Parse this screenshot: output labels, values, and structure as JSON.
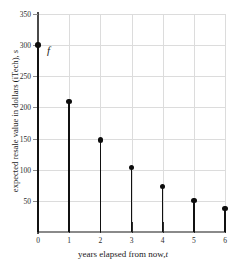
{
  "chart_data": {
    "type": "scatter",
    "plot_style": "stem",
    "title": "",
    "xlabel": "years elapsed from now, t",
    "ylabel": "expected resale value in dollars (iTech), s",
    "xlabel_main": "years elapsed from now,",
    "xlabel_var": "t",
    "ylabel_main": "expected resale value in dollars (iTech),",
    "ylabel_var": "s",
    "x": [
      0,
      1,
      2,
      3,
      4,
      5,
      6
    ],
    "values": [
      300,
      210,
      148,
      104,
      73,
      51,
      38
    ],
    "xlim": [
      0,
      6
    ],
    "ylim": [
      0,
      350
    ],
    "xticks": [
      "0",
      "1",
      "2",
      "3",
      "4",
      "5",
      "6"
    ],
    "yticks": [
      "50",
      "100",
      "150",
      "200",
      "250",
      "300",
      "350"
    ],
    "ytick_values": [
      50,
      100,
      150,
      200,
      250,
      300,
      350
    ],
    "grid": true,
    "grid_color": "#dcdcdc",
    "legend": "none",
    "annotations": [
      {
        "text": "f",
        "x": 0.45,
        "y": 272,
        "style": "italic"
      }
    ],
    "marker_color": "#0d0d0d",
    "stem_color": "#111111",
    "axis_color": "#4a4a4a"
  },
  "annotation_label": "f"
}
